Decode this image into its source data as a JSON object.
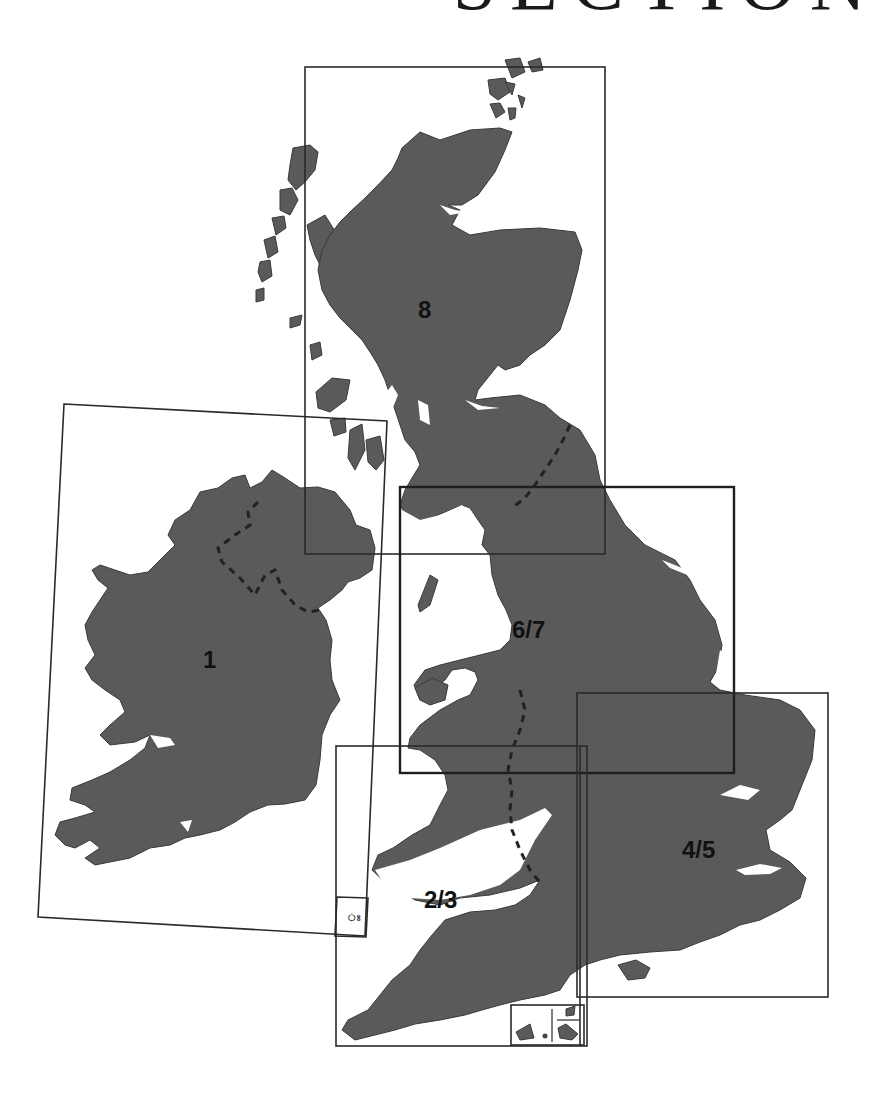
{
  "heading": {
    "text": "SECTION",
    "partially_visible": true
  },
  "map": {
    "title": "Section index map of the British Isles",
    "colors": {
      "land": "#5a5a5a",
      "frame": "#2a2a2a",
      "background": "#ffffff",
      "border_dashes": "#222222"
    },
    "sections": [
      {
        "id": "1",
        "label": "1",
        "region": "Ireland"
      },
      {
        "id": "2/3",
        "label": "2/3",
        "region": "Wales and South West England"
      },
      {
        "id": "4/5",
        "label": "4/5",
        "region": "South East England and East Anglia"
      },
      {
        "id": "6/7",
        "label": "6/7",
        "region": "Northern England and Midlands"
      },
      {
        "id": "8",
        "label": "8",
        "region": "Scotland"
      }
    ],
    "insets": [
      {
        "name": "isle-of-man-inset",
        "description": "small inset box near Ireland section"
      },
      {
        "name": "channel-islands-scilly-inset",
        "description": "inset box at bottom of section 2/3"
      }
    ]
  }
}
